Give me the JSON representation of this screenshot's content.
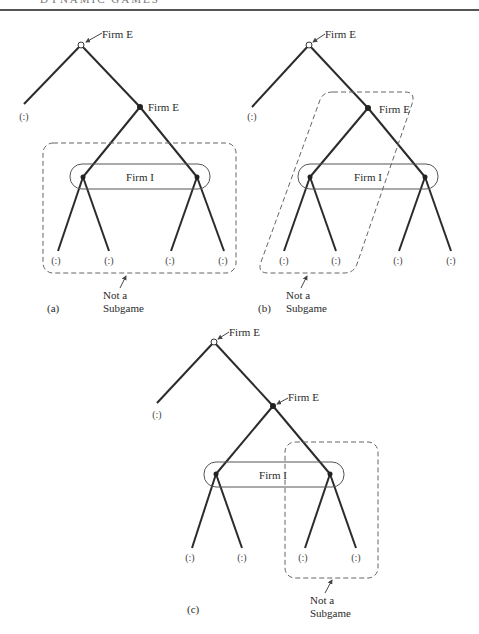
{
  "header": {
    "title": "DYNAMIC GAMES"
  },
  "labels": {
    "decision_node": "Firm E",
    "info_set": "Firm I",
    "payoff": "(:)",
    "not_subgame_line1": "Not a",
    "not_subgame_line2": "Subgame"
  },
  "panels": [
    {
      "id": "a",
      "caption": "(a)",
      "root_label": "Firm E",
      "second_label": "Firm E",
      "info_set_label": "Firm I",
      "note_line1": "Not a",
      "note_line2": "Subgame",
      "leaves": [
        "(:)",
        "(:)",
        "(:)",
        "(:)",
        "(:)"
      ]
    },
    {
      "id": "b",
      "caption": "(b)",
      "root_label": "Firm E",
      "second_label": "Firm E",
      "info_set_label": "Firm I",
      "note_line1": "Not a",
      "note_line2": "Subgame",
      "leaves": [
        "(:)",
        "(:)",
        "(:)",
        "(:)",
        "(:)"
      ]
    },
    {
      "id": "c",
      "caption": "(c)",
      "root_label": "Firm E",
      "second_label": "Firm E",
      "info_set_label": "Firm I",
      "note_line1": "Not a",
      "note_line2": "Subgame",
      "leaves": [
        "(:)",
        "(:)",
        "(:)",
        "(:)",
        "(:)"
      ]
    }
  ],
  "colors": {
    "line": "#2b2b2b",
    "dashed": "#666666",
    "background": "#ffffff"
  }
}
